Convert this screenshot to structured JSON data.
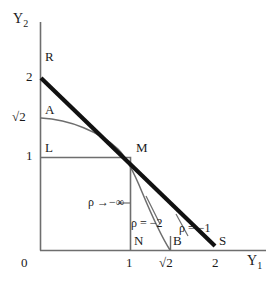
{
  "figure": {
    "type": "diagram",
    "background": "#ffffff",
    "line_color_thin": "#6e6e6e",
    "line_color_thick": "#111111"
  },
  "axes": {
    "y_axis_label": "Y",
    "y_axis_sub": "2",
    "x_axis_label": "Y",
    "x_axis_sub": "1",
    "origin_label": "0",
    "y_ticks": [
      {
        "label": "2",
        "value": 2
      },
      {
        "label": "√2",
        "value": 1.4142
      },
      {
        "label": "1",
        "value": 1
      }
    ],
    "x_ticks": [
      {
        "label": "1",
        "value": 1
      },
      {
        "label": "√2",
        "value": 1.4142
      },
      {
        "label": "2",
        "value": 2
      }
    ],
    "xlim": [
      0,
      2.5
    ],
    "ylim": [
      0,
      2.55
    ],
    "grid": false
  },
  "points": [
    {
      "name": "R",
      "label": "R",
      "x": 0,
      "y": 2
    },
    {
      "name": "A",
      "label": "A",
      "x": 0,
      "y": 1.4142
    },
    {
      "name": "L",
      "label": "L",
      "x": 0,
      "y": 1
    },
    {
      "name": "M",
      "label": "M",
      "x": 1,
      "y": 1
    },
    {
      "name": "N",
      "label": "N",
      "x": 1,
      "y": 0
    },
    {
      "name": "B",
      "label": "B",
      "x": 1.4142,
      "y": 0
    },
    {
      "name": "S",
      "label": "S",
      "x": 2,
      "y": 0
    }
  ],
  "curves": [
    {
      "name": "rho-minus-one",
      "label": "ρ = −1",
      "kind": "line",
      "from": {
        "x": 0,
        "y": 2
      },
      "to": {
        "x": 2,
        "y": 0
      },
      "weight": "thick"
    },
    {
      "name": "rho-minus-two",
      "label": "ρ = −2",
      "kind": "curve",
      "from": {
        "x": 0,
        "y": 1.4142
      },
      "through": {
        "x": 1,
        "y": 1
      },
      "to": {
        "x": 1.4142,
        "y": 0
      },
      "weight": "thin"
    },
    {
      "name": "rho-to-minus-infinity",
      "label": "ρ →−∞",
      "kind": "corner",
      "vertex": {
        "x": 1,
        "y": 1
      },
      "arms": [
        {
          "x": 0,
          "y": 1
        },
        {
          "x": 1,
          "y": 0
        }
      ],
      "weight": "thin"
    }
  ],
  "annotations": {
    "rho_inf": "ρ →−∞",
    "rho_two": "ρ = −2",
    "rho_one": "ρ = −1"
  }
}
